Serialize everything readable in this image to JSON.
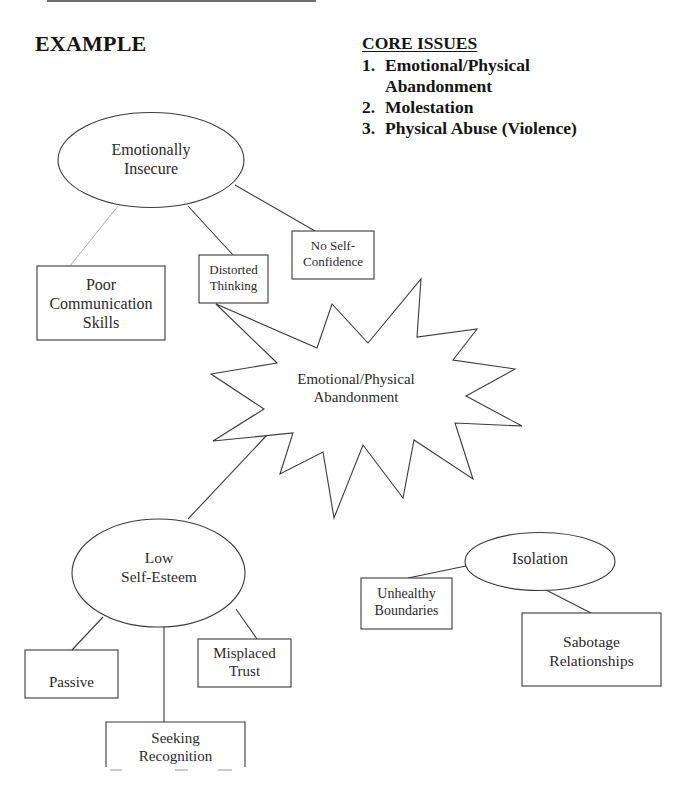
{
  "heading": "EXAMPLE",
  "core_issues": {
    "title": "CORE ISSUES",
    "items": [
      {
        "num": "1.",
        "text": "Emotional/Physical\nAbandonment"
      },
      {
        "num": "2.",
        "text": "Molestation"
      },
      {
        "num": "3.",
        "text": "Physical Abuse (Violence)"
      }
    ]
  },
  "colors": {
    "line": "#3a3a3a",
    "faint_line": "#a8a8a8",
    "text": "#2a2a2a",
    "background": "#ffffff"
  },
  "nodes": {
    "emotionally_insecure": {
      "shape": "ellipse",
      "label": "Emotionally\nInsecure"
    },
    "poor_communication": {
      "shape": "box",
      "label": "Poor\nCommunication\nSkills"
    },
    "distorted_thinking": {
      "shape": "box",
      "label": "Distorted\nThinking"
    },
    "no_self_confidence": {
      "shape": "box",
      "label": "No Self-\nConfidence"
    },
    "core_abandonment": {
      "shape": "starburst",
      "label": "Emotional/Physical\nAbandonment"
    },
    "low_self_esteem": {
      "shape": "ellipse",
      "label": "Low\nSelf-Esteem"
    },
    "passive": {
      "shape": "box",
      "label": "Passive"
    },
    "misplaced_trust": {
      "shape": "box",
      "label": "Misplaced\nTrust"
    },
    "seeking_recognition": {
      "shape": "box",
      "label": "Seeking\nRecognition"
    },
    "isolation": {
      "shape": "ellipse",
      "label": "Isolation"
    },
    "unhealthy_boundaries": {
      "shape": "box",
      "label": "Unhealthy\nBoundaries"
    },
    "sabotage_relationships": {
      "shape": "box",
      "label": "Sabotage\nRelationships"
    }
  },
  "edges": [
    {
      "from": "emotionally_insecure",
      "to": "poor_communication"
    },
    {
      "from": "emotionally_insecure",
      "to": "distorted_thinking"
    },
    {
      "from": "emotionally_insecure",
      "to": "no_self_confidence"
    },
    {
      "from": "distorted_thinking",
      "to": "core_abandonment"
    },
    {
      "from": "core_abandonment",
      "to": "low_self_esteem"
    },
    {
      "from": "low_self_esteem",
      "to": "passive"
    },
    {
      "from": "low_self_esteem",
      "to": "seeking_recognition"
    },
    {
      "from": "low_self_esteem",
      "to": "misplaced_trust"
    },
    {
      "from": "isolation",
      "to": "unhealthy_boundaries"
    },
    {
      "from": "isolation",
      "to": "sabotage_relationships"
    }
  ]
}
